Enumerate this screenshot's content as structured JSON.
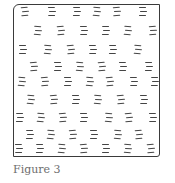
{
  "figure": {
    "caption": "Figure 3",
    "stroke_color": "#3a3a3a",
    "dash_color": "#444444",
    "box": {
      "x": 13,
      "y": 4,
      "width": 147,
      "height": 153
    },
    "clusters": [
      [
        24,
        11
      ],
      [
        51,
        11
      ],
      [
        76,
        11
      ],
      [
        96,
        11
      ],
      [
        116,
        11
      ],
      [
        142,
        11
      ],
      [
        37,
        30
      ],
      [
        60,
        30
      ],
      [
        83,
        30
      ],
      [
        105,
        30
      ],
      [
        127,
        30
      ],
      [
        152,
        30
      ],
      [
        22,
        49
      ],
      [
        47,
        49
      ],
      [
        70,
        49
      ],
      [
        92,
        49
      ],
      [
        112,
        49
      ],
      [
        137,
        49
      ],
      [
        33,
        66
      ],
      [
        57,
        66
      ],
      [
        79,
        66
      ],
      [
        101,
        66
      ],
      [
        122,
        66
      ],
      [
        148,
        66
      ],
      [
        21,
        81
      ],
      [
        44,
        81
      ],
      [
        67,
        81
      ],
      [
        89,
        81
      ],
      [
        109,
        81
      ],
      [
        133,
        81
      ],
      [
        154,
        81
      ],
      [
        30,
        99
      ],
      [
        53,
        99
      ],
      [
        75,
        99
      ],
      [
        97,
        99
      ],
      [
        120,
        99
      ],
      [
        143,
        99
      ],
      [
        19,
        117
      ],
      [
        40,
        117
      ],
      [
        62,
        117
      ],
      [
        83,
        117
      ],
      [
        108,
        117
      ],
      [
        128,
        117
      ],
      [
        152,
        117
      ],
      [
        29,
        134
      ],
      [
        50,
        134
      ],
      [
        72,
        134
      ],
      [
        93,
        134
      ],
      [
        117,
        134
      ],
      [
        138,
        134
      ],
      [
        18,
        148
      ],
      [
        39,
        148
      ],
      [
        61,
        148
      ],
      [
        83,
        148
      ],
      [
        105,
        148
      ],
      [
        127,
        148
      ],
      [
        150,
        148
      ]
    ]
  }
}
